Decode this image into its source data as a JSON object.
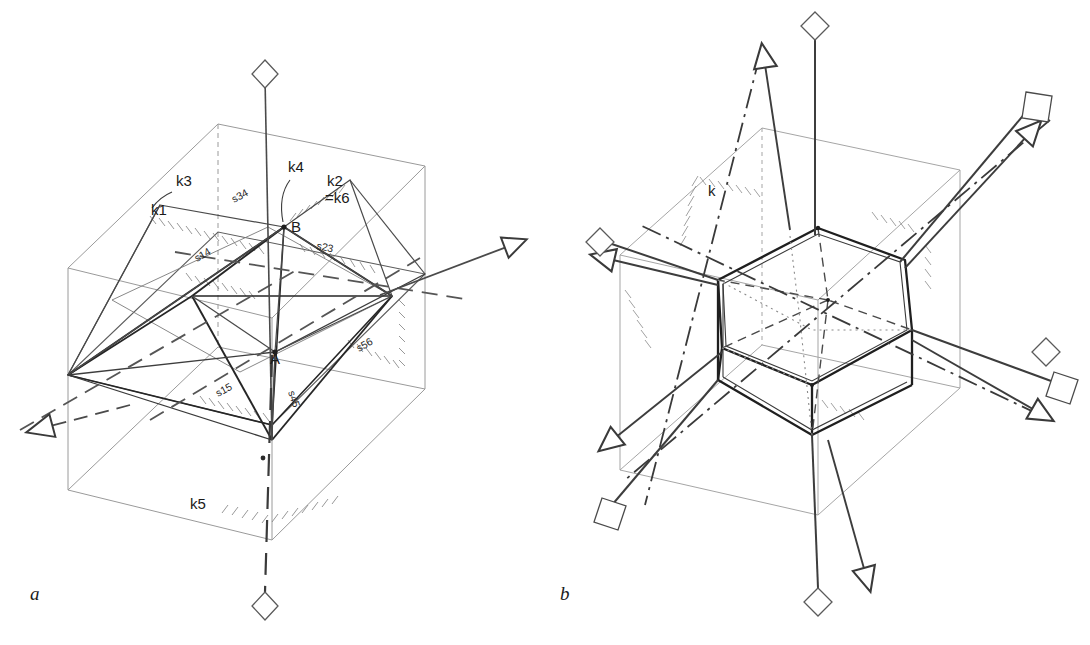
{
  "figure": {
    "background": "#ffffff",
    "ink": "#2b2b2b",
    "ink_light": "#8e8e8e",
    "ink_mid": "#5a5a5a"
  },
  "panels": [
    {
      "id": "a",
      "label": "a",
      "label_x": 30,
      "label_y": 600,
      "description": "Cubic outer cell with inscribed trigonal/octahedral body, mirror planes with hatching, rotation axes k1-k6 and mirror planes s14, s23, s34, s15, s45, s56",
      "points": [
        {
          "name": "B",
          "label": "B",
          "x": 284,
          "y": 227
        },
        {
          "name": "A",
          "label": "A",
          "x": 275,
          "y": 352
        }
      ],
      "axis_labels": [
        {
          "name": "k1",
          "label": "k1",
          "x": 151,
          "y": 215
        },
        {
          "name": "k3",
          "label": "k3",
          "x": 176,
          "y": 186
        },
        {
          "name": "k4",
          "label": "k4",
          "x": 288,
          "y": 172
        },
        {
          "name": "k2",
          "label": "k2",
          "x": 327,
          "y": 186
        },
        {
          "name": "k6",
          "label": "=k6",
          "x": 325,
          "y": 203
        },
        {
          "name": "k5",
          "label": "k5",
          "x": 190,
          "y": 509
        }
      ],
      "plane_labels": [
        {
          "name": "s34",
          "label": "s34",
          "x": 234,
          "y": 203,
          "rot": -28
        },
        {
          "name": "s14",
          "label": "s14",
          "x": 197,
          "y": 262,
          "rot": -30
        },
        {
          "name": "s23",
          "label": "s23",
          "x": 316,
          "y": 249,
          "rot": 12
        },
        {
          "name": "s56",
          "label": "s56",
          "x": 359,
          "y": 352,
          "rot": -30
        },
        {
          "name": "s15",
          "label": "s15",
          "x": 218,
          "y": 397,
          "rot": -28
        },
        {
          "name": "s45",
          "label": "s45",
          "x": 288,
          "y": 392,
          "rot": 72
        }
      ]
    },
    {
      "id": "b",
      "label": "b",
      "label_x": 560,
      "label_y": 600,
      "description": "Rhombohedral/hexagonal prism cell inside cube outline with dash-dot symmetry axes terminating in arrows, squares and diamonds",
      "axis_labels": [
        {
          "name": "k",
          "label": "k",
          "x": 708,
          "y": 196
        }
      ]
    }
  ],
  "terminators": {
    "arrow": "open-triangle-arrowhead",
    "diamond": "open-rhombus-marker",
    "square": "open-square-marker"
  }
}
